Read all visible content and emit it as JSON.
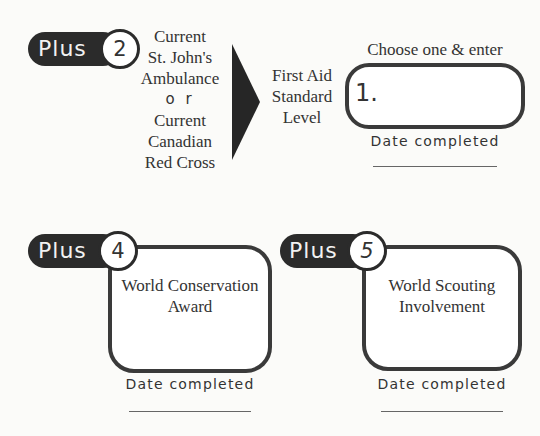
{
  "section2": {
    "badge_word": "Plus",
    "badge_number": "2",
    "options_lines": [
      "Current",
      "St. John's",
      "Ambulance",
      "o r",
      "Current",
      "Canadian",
      "Red Cross"
    ],
    "level_lines": [
      "First Aid",
      "Standard",
      "Level"
    ],
    "instruction": "Choose one & enter",
    "entry_prefix": "1.",
    "date_label": "Date completed"
  },
  "section4": {
    "badge_word": "Plus",
    "badge_number": "4",
    "title_lines": [
      "World Conservation",
      "Award"
    ],
    "date_label": "Date completed"
  },
  "section5": {
    "badge_word": "Plus",
    "badge_number": "5",
    "title_lines": [
      "World Scouting",
      "Involvement"
    ],
    "date_label": "Date completed"
  },
  "colors": {
    "badge": "#2b2b2b",
    "border": "#3a3a3a",
    "background": "#fbfbf9"
  }
}
